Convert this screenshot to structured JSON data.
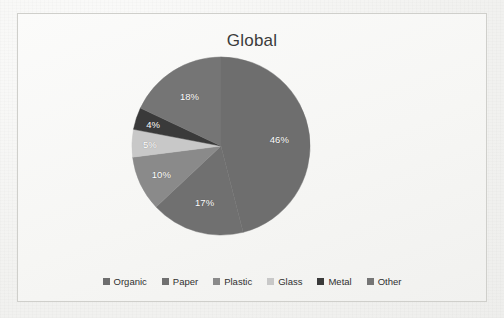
{
  "chart_data": {
    "type": "pie",
    "title": "Global",
    "categories": [
      "Organic",
      "Paper",
      "Plastic",
      "Glass",
      "Metal",
      "Other"
    ],
    "values": [
      46,
      17,
      10,
      5,
      4,
      18
    ],
    "value_labels": [
      "46%",
      "17%",
      "10%",
      "5%",
      "4%",
      "18%"
    ],
    "unit": "%",
    "total": 100,
    "start_angle_deg": 0,
    "direction": "clockwise",
    "legend_position": "bottom",
    "grid": false,
    "xlabel": "",
    "ylabel": "",
    "colors": [
      "#6e6e6e",
      "#707070",
      "#8a8a8a",
      "#c8c8c8",
      "#3a3a3a",
      "#757575"
    ]
  },
  "legend": {
    "items": [
      {
        "label": "Organic",
        "color": "#6e6e6e"
      },
      {
        "label": "Paper",
        "color": "#707070"
      },
      {
        "label": "Plastic",
        "color": "#8a8a8a"
      },
      {
        "label": "Glass",
        "color": "#c8c8c8"
      },
      {
        "label": "Metal",
        "color": "#3a3a3a"
      },
      {
        "label": "Other",
        "color": "#757575"
      }
    ]
  }
}
